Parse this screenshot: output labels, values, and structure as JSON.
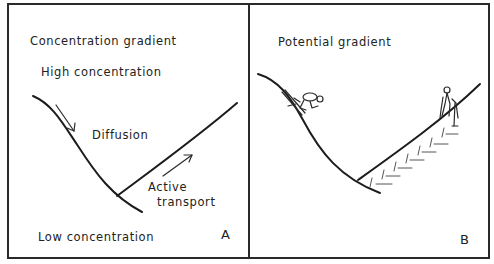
{
  "figure": {
    "panels": [
      {
        "id": "A",
        "title": "Concentration gradient",
        "top_label": "High concentration",
        "bottom_label": "Low concentration",
        "downhill_label": "Diffusion",
        "uphill_label_line1": "Active",
        "uphill_label_line2": "transport",
        "letter": "A"
      },
      {
        "id": "B",
        "title": "Potential gradient",
        "downhill_figure": "skier",
        "uphill_figure": "climber",
        "letter": "B"
      }
    ],
    "colors": {
      "ink": "#1c1c1c",
      "background": "#ffffff"
    }
  }
}
